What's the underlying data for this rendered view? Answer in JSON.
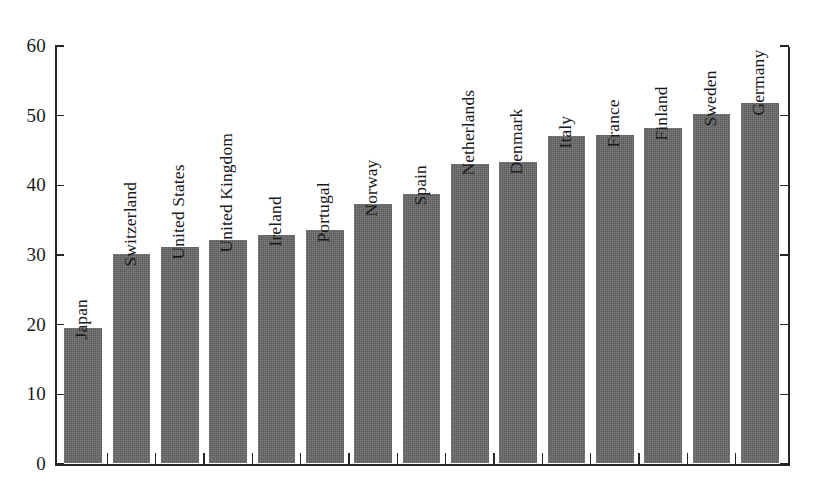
{
  "chart_data": {
    "type": "bar",
    "title": "",
    "subtitle": "",
    "xlabel": "",
    "ylabel": "",
    "ylim": [
      0,
      60
    ],
    "yticks": [
      0,
      10,
      20,
      30,
      40,
      50,
      60
    ],
    "grid": false,
    "legend": false,
    "orientation": "vertical",
    "bar_color": "#5b5b5b",
    "axis_color": "#262626",
    "background": "#ffffff",
    "categories": [
      "Japan",
      "Switzerland",
      "United States",
      "United Kingdom",
      "Ireland",
      "Portugal",
      "Norway",
      "Spain",
      "Netherlands",
      "Denmark",
      "Italy",
      "France",
      "Finland",
      "Sweden",
      "Germany"
    ],
    "values": [
      19.5,
      30.0,
      31.0,
      32.0,
      32.8,
      33.5,
      37.2,
      38.7,
      43.0,
      43.2,
      47.0,
      47.1,
      48.1,
      50.1,
      51.7
    ]
  },
  "axis": {
    "tick_labels": [
      "0",
      "10",
      "20",
      "30",
      "40",
      "50",
      "60"
    ]
  }
}
